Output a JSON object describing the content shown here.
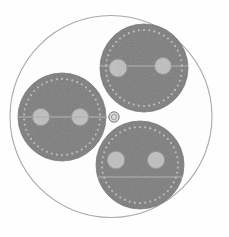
{
  "figure": {
    "width": 229,
    "height": 237,
    "background_color": "#fefefe"
  },
  "colors": {
    "background": "#fefefe",
    "sheath_fill": "#fdfdfd",
    "sheath_stroke": "#a9a9a9",
    "core_fill": "#7c7c7c",
    "core_stroke": "#6f6f6f",
    "screen_dot": "#c9c9c9",
    "conductor_fill": "#bfbfbf",
    "conductor_stroke": "#8f8f8f",
    "filler_fill": "#efefef",
    "filler_stroke": "#9a9a9a",
    "center_circle_fill": "#d8d8d8",
    "center_circle_stroke": "#7a7a7a",
    "axis_line": "#9e9e9e"
  },
  "outer_sheath": {
    "label": "outer-sheath",
    "cx": 111,
    "cy": 116.5,
    "r": 101,
    "stroke_width": 1.1
  },
  "center_filler": {
    "label": "center-filler-circle",
    "cx": 114,
    "cy": 117,
    "r": 5.2,
    "inner_r": 2.6
  },
  "cores": [
    {
      "name": "core-left",
      "cx": 62,
      "cy": 117,
      "r": 44,
      "screen_ring_r": 38,
      "screen_dot_count": 46,
      "screen_dot_r": 1.05,
      "divider_line": {
        "y_offset": 0,
        "half_width": 44
      },
      "conductors": [
        {
          "name": "conductor-left-a",
          "dx": -21,
          "dy": 0,
          "r": 8.6
        },
        {
          "name": "conductor-left-b",
          "dx": 18,
          "dy": 0,
          "r": 8.6
        }
      ]
    },
    {
      "name": "core-top-right",
      "cx": 144,
      "cy": 68,
      "r": 44,
      "screen_ring_r": 38,
      "screen_dot_count": 46,
      "screen_dot_r": 1.05,
      "divider_line": {
        "y_offset": -2,
        "half_width": 44
      },
      "conductors": [
        {
          "name": "conductor-top-a",
          "dx": -26,
          "dy": 0,
          "r": 9.0
        },
        {
          "name": "conductor-top-b",
          "dx": 19,
          "dy": -2,
          "r": 8.4
        }
      ]
    },
    {
      "name": "core-bottom-right",
      "cx": 140,
      "cy": 165,
      "r": 44,
      "screen_ring_r": 38,
      "screen_dot_count": 46,
      "screen_dot_r": 1.05,
      "divider_line": {
        "y_offset": 12,
        "half_width": 42
      },
      "conductors": [
        {
          "name": "conductor-bottom-a",
          "dx": -24,
          "dy": -5,
          "r": 8.8
        },
        {
          "name": "conductor-bottom-b",
          "dx": 16,
          "dy": -5,
          "r": 8.6
        }
      ]
    }
  ],
  "guide_lines": [
    {
      "name": "axis-line-horizontal",
      "x1": 18,
      "y1": 117,
      "x2": 112,
      "y2": 117
    }
  ]
}
